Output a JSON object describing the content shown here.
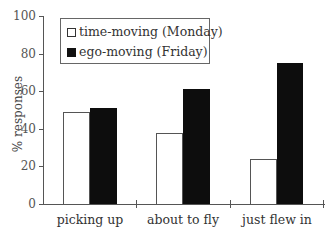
{
  "chart_data": {
    "type": "bar",
    "title": "",
    "xlabel": "",
    "ylabel": "% responses",
    "ylim": [
      0,
      100
    ],
    "yticks": [
      0,
      20,
      40,
      60,
      80,
      100
    ],
    "categories": [
      "picking up",
      "about to fly",
      "just flew in"
    ],
    "series": [
      {
        "name": "time-moving (Monday)",
        "color": "#ffffff",
        "values": [
          49,
          38,
          24
        ]
      },
      {
        "name": "ego-moving (Friday)",
        "color": "#0d0d0d",
        "values": [
          51,
          61,
          75
        ]
      }
    ],
    "legend_position": "upper left",
    "grid": false
  },
  "labels": {
    "ytick_0": "0",
    "ytick_20": "20",
    "ytick_40": "40",
    "ytick_60": "60",
    "ytick_80": "80",
    "ytick_100": "100",
    "ytitle": "% responses",
    "cat_0": "picking up",
    "cat_1": "about to fly",
    "cat_2": "just flew in",
    "legend_0": "time-moving (Monday)",
    "legend_1": "ego-moving (Friday)"
  }
}
